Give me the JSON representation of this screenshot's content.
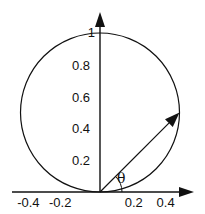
{
  "diagram": {
    "title": "",
    "x_axis": {
      "ticks": [
        {
          "value": -0.4,
          "label": "-0.4"
        },
        {
          "value": -0.2,
          "label": "-0.2"
        },
        {
          "value": 0.2,
          "label": "0.2"
        },
        {
          "value": 0.4,
          "label": "0.4"
        }
      ]
    },
    "y_axis": {
      "ticks": [
        {
          "value": 0.2,
          "label": "0.2"
        },
        {
          "value": 0.4,
          "label": "0.4"
        },
        {
          "value": 0.6,
          "label": "0.6"
        },
        {
          "value": 0.8,
          "label": "0.8"
        },
        {
          "value": 1,
          "label": "1"
        }
      ]
    },
    "circle": {
      "center": [
        0,
        0.5
      ],
      "radius": 0.5
    },
    "vector": {
      "from": [
        0,
        0
      ],
      "to": [
        0.5,
        0.5
      ]
    },
    "angle_label": "θ",
    "color": "#111111"
  }
}
